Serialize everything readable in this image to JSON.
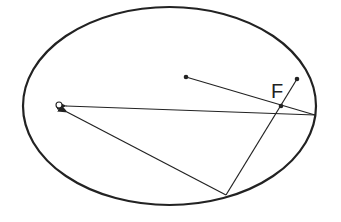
{
  "diagram": {
    "type": "ellipse-reflection",
    "colors": {
      "stroke": "#222222",
      "background": "#ffffff"
    },
    "ellipse": {
      "cx": 169.5,
      "cy": 106,
      "rx": 146.5,
      "ry": 99
    },
    "points": {
      "center_dot": {
        "x": 186,
        "y": 77
      },
      "upper_dot": {
        "x": 297,
        "y": 79
      },
      "focus_F": {
        "x": 281,
        "y": 106
      },
      "origin_circle": {
        "x": 59,
        "y": 105
      },
      "right_vertex": {
        "x": 315,
        "y": 115
      },
      "bottom_point": {
        "x": 226,
        "y": 195
      }
    },
    "labels": {
      "focus": "F"
    }
  }
}
